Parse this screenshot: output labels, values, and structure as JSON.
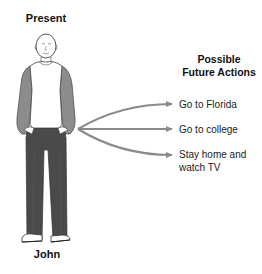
{
  "diagram": {
    "present_label": "Present",
    "person_name": "John",
    "future_heading": "Possible Future Actions",
    "actions": [
      {
        "label": "Go to Florida"
      },
      {
        "label": "Go to college"
      },
      {
        "label": "Stay home and watch TV"
      }
    ],
    "colors": {
      "arrow": "#8a8a8a",
      "sleeves": "#8c8c8c",
      "pants": "#4a4a4a",
      "outline": "#333333",
      "text": "#111111"
    }
  }
}
